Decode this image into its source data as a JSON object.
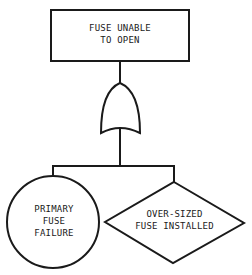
{
  "diagram": {
    "type": "fault-tree",
    "top_event": {
      "shape": "rectangle",
      "lines": [
        "FUSE UNABLE",
        "TO OPEN"
      ]
    },
    "gate": {
      "type": "OR"
    },
    "children": [
      {
        "shape": "circle",
        "kind": "basic-event",
        "lines": [
          "PRIMARY",
          "FUSE",
          "FAILURE"
        ]
      },
      {
        "shape": "diamond",
        "kind": "undeveloped-event",
        "lines": [
          "OVER-SIZED",
          "FUSE INSTALLED"
        ]
      }
    ],
    "colors": {
      "stroke": "#1a1a1a",
      "background": "#ffffff"
    }
  }
}
